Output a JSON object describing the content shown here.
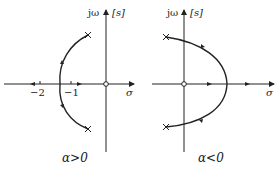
{
  "figure": {
    "type": "root-locus",
    "colors": {
      "line": "#222222",
      "background": "#ffffff"
    },
    "panels": [
      {
        "id": "left",
        "caption": "α>0",
        "axis_labels": {
          "imag": "jω",
          "plane": "[s]",
          "real": "σ"
        },
        "tick_labels": [
          "−2",
          "−1"
        ],
        "markers": {
          "poles": "×",
          "zero": "○"
        },
        "description": "Complex conjugate poles; locus arcs to the left and meets the real axis near −1.4, then branches move along the negative real axis toward −2 and toward the zero at the origin"
      },
      {
        "id": "right",
        "caption": "α<0",
        "axis_labels": {
          "imag": "jω",
          "plane": "[s]",
          "real": "σ"
        },
        "tick_labels": [],
        "markers": {
          "poles": "×",
          "zero": "○"
        },
        "description": "Complex conjugate poles in left half plane; locus arcs to the right, crossing into the right half plane and meeting the positive real axis, then branches move along the positive real axis"
      }
    ]
  }
}
